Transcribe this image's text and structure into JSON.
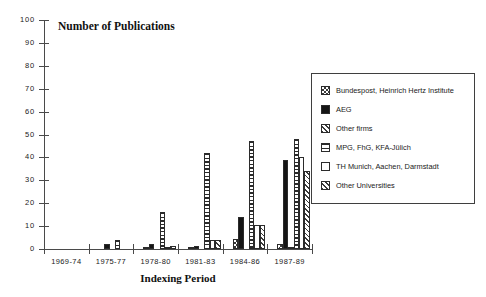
{
  "chart_data": {
    "type": "bar",
    "title": "Number of Publications",
    "xlabel": "Indexing Period",
    "ylabel": "",
    "ylim": [
      0,
      100
    ],
    "yticks": [
      0,
      10,
      20,
      30,
      40,
      50,
      60,
      70,
      80,
      90,
      100
    ],
    "ytick_labels": [
      "0",
      "10",
      "20",
      "30",
      "40",
      "50",
      "60",
      "70",
      "80",
      "90",
      "100"
    ],
    "grid": false,
    "legend_position": "right",
    "categories": [
      "1969-74",
      "1975-77",
      "1978-80",
      "1981-83",
      "1984-86",
      "1987-89"
    ],
    "series": [
      {
        "name": "Bundespost, Heinrich Hertz Institute",
        "pattern": "checkerboard",
        "values": [
          0,
          0,
          1,
          1,
          4.5,
          2
        ]
      },
      {
        "name": "AEG",
        "pattern": "solid-black",
        "values": [
          0,
          2,
          2,
          1.5,
          14,
          39
        ]
      },
      {
        "name": "Other firms",
        "pattern": "diagonal-hatch",
        "values": [
          0,
          0,
          0,
          0,
          0,
          1
        ]
      },
      {
        "name": "MPG, FhG, KFA-Jülich",
        "pattern": "horizontal-lines",
        "values": [
          0,
          4,
          16,
          42,
          47,
          48
        ]
      },
      {
        "name": "TH Munich, Aachen, Darmstadt",
        "pattern": "white-empty",
        "values": [
          0,
          0,
          0.5,
          4,
          10.5,
          40
        ]
      },
      {
        "name": "Other Universities",
        "pattern": "diagonal-hatch",
        "values": [
          0,
          0,
          1.5,
          4,
          10.5,
          34
        ]
      }
    ]
  },
  "legend": {
    "entries": [
      "Bundespost, Heinrich Hertz Institute",
      "AEG",
      "Other firms",
      "MPG, FhG, KFA-Jülich",
      "TH Munich, Aachen, Darmstadt",
      "Other Universities"
    ]
  },
  "colors": {
    "axis": "#4a4a4a",
    "text": "#1a1a1a",
    "bar_outline": "#2b2b2b",
    "pattern_ink": "#3a3a3a",
    "solid_fill": "#151515",
    "background": "#ffffff"
  }
}
